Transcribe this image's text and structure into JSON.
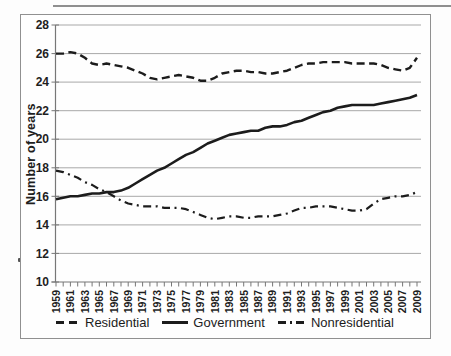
{
  "figure": {
    "background_color": "#fdfdfd",
    "frame_color": "#909090",
    "line_color": "#1c1c1c",
    "grid_color": "#a8a8a8",
    "axis_color": "#777777"
  },
  "chart_data": {
    "type": "line",
    "title": "",
    "xlabel": "",
    "ylabel": "Number of years",
    "ylim": [
      10,
      28
    ],
    "y_ticks": [
      10,
      12,
      14,
      16,
      18,
      20,
      22,
      24,
      26,
      28
    ],
    "grid": true,
    "legend_position": "bottom",
    "x": [
      1959,
      1960,
      1961,
      1962,
      1963,
      1964,
      1965,
      1966,
      1967,
      1968,
      1969,
      1970,
      1971,
      1972,
      1973,
      1974,
      1975,
      1976,
      1977,
      1978,
      1979,
      1980,
      1981,
      1982,
      1983,
      1984,
      1985,
      1986,
      1987,
      1988,
      1989,
      1990,
      1991,
      1992,
      1993,
      1994,
      1995,
      1996,
      1997,
      1998,
      1999,
      2000,
      2001,
      2002,
      2003,
      2004,
      2005,
      2006,
      2007,
      2008,
      2009
    ],
    "x_tick_labels": [
      "1959",
      "1961",
      "1963",
      "1965",
      "1967",
      "1969",
      "1971",
      "1973",
      "1975",
      "1977",
      "1979",
      "1981",
      "1983",
      "1985",
      "1987",
      "1989",
      "1991",
      "1993",
      "1995",
      "1997",
      "1999",
      "2001",
      "2003",
      "2005",
      "2007",
      "2009"
    ],
    "series": [
      {
        "name": "Residential",
        "line_style": "dashed",
        "values": [
          26.0,
          26.0,
          26.1,
          26.0,
          25.7,
          25.3,
          25.2,
          25.3,
          25.2,
          25.1,
          25.0,
          24.8,
          24.6,
          24.3,
          24.2,
          24.3,
          24.4,
          24.5,
          24.4,
          24.3,
          24.1,
          24.1,
          24.3,
          24.6,
          24.7,
          24.8,
          24.8,
          24.7,
          24.7,
          24.6,
          24.6,
          24.7,
          24.8,
          25.0,
          25.2,
          25.3,
          25.3,
          25.4,
          25.4,
          25.4,
          25.4,
          25.3,
          25.3,
          25.3,
          25.3,
          25.2,
          25.0,
          24.9,
          24.8,
          25.0,
          25.7
        ]
      },
      {
        "name": "Government",
        "line_style": "solid",
        "values": [
          15.8,
          15.9,
          16.0,
          16.0,
          16.1,
          16.2,
          16.2,
          16.3,
          16.3,
          16.4,
          16.6,
          16.9,
          17.2,
          17.5,
          17.8,
          18.0,
          18.3,
          18.6,
          18.9,
          19.1,
          19.4,
          19.7,
          19.9,
          20.1,
          20.3,
          20.4,
          20.5,
          20.6,
          20.6,
          20.8,
          20.9,
          20.9,
          21.0,
          21.2,
          21.3,
          21.5,
          21.7,
          21.9,
          22.0,
          22.2,
          22.3,
          22.4,
          22.4,
          22.4,
          22.4,
          22.5,
          22.6,
          22.7,
          22.8,
          22.9,
          23.1
        ]
      },
      {
        "name": "Nonresidential",
        "line_style": "dashdot",
        "values": [
          17.8,
          17.7,
          17.5,
          17.3,
          17.0,
          16.8,
          16.5,
          16.3,
          16.0,
          15.7,
          15.5,
          15.4,
          15.3,
          15.3,
          15.3,
          15.2,
          15.2,
          15.2,
          15.1,
          14.9,
          14.7,
          14.5,
          14.4,
          14.5,
          14.6,
          14.6,
          14.5,
          14.5,
          14.6,
          14.6,
          14.6,
          14.7,
          14.8,
          15.0,
          15.2,
          15.2,
          15.3,
          15.3,
          15.3,
          15.2,
          15.1,
          15.0,
          15.0,
          15.1,
          15.5,
          15.8,
          15.9,
          16.0,
          16.0,
          16.1,
          16.3
        ]
      }
    ]
  }
}
